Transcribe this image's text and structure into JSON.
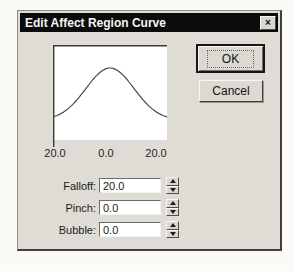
{
  "window": {
    "title": "Edit Affect Region Curve",
    "close_icon": "×"
  },
  "buttons": {
    "ok": "OK",
    "cancel": "Cancel"
  },
  "chart": {
    "axis_labels": [
      "20.0",
      "0.0",
      "20.0"
    ],
    "curve": {
      "type": "line",
      "shape": "gaussian-bell",
      "width": 114,
      "height": 95,
      "center_x": 57,
      "sigma": 24,
      "baseline_y": 75,
      "amplitude": 52
    }
  },
  "fields": [
    {
      "label": "Falloff:",
      "value": "20.0"
    },
    {
      "label": "Pinch:",
      "value": "0.0"
    },
    {
      "label": "Bubble:",
      "value": "0.0"
    }
  ]
}
